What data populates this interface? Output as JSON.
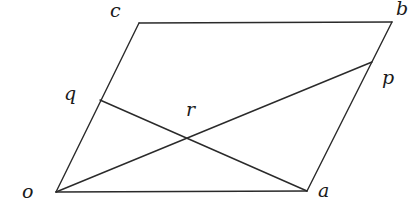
{
  "diagram": {
    "type": "parallelogram-with-diagonals",
    "stroke_color": "#2a2a2a",
    "points": {
      "o": {
        "label": "o",
        "x": 56,
        "y": 192,
        "lx": 22,
        "ly": 198
      },
      "a": {
        "label": "a",
        "x": 307,
        "y": 191,
        "lx": 318,
        "ly": 197
      },
      "b": {
        "label": "b",
        "x": 392,
        "y": 22,
        "lx": 396,
        "ly": 15
      },
      "c": {
        "label": "c",
        "x": 139,
        "y": 23,
        "lx": 110,
        "ly": 17
      },
      "q": {
        "label": "q",
        "x": 100,
        "y": 100,
        "lx": 64,
        "ly": 100
      },
      "p": {
        "label": "p",
        "x": 372,
        "y": 62,
        "lx": 382,
        "ly": 84
      },
      "r": {
        "label": "r",
        "x": 186,
        "y": 139,
        "lx": 186,
        "ly": 116
      }
    },
    "segments": [
      {
        "name": "side-oa",
        "from": "o",
        "to": "a"
      },
      {
        "name": "side-ab",
        "from": "a",
        "to": "b"
      },
      {
        "name": "side-bc",
        "from": "b",
        "to": "c"
      },
      {
        "name": "side-co",
        "from": "c",
        "to": "o"
      },
      {
        "name": "line-op",
        "from": "o",
        "to": "p"
      },
      {
        "name": "line-aq",
        "from": "a",
        "to": "q"
      }
    ]
  }
}
